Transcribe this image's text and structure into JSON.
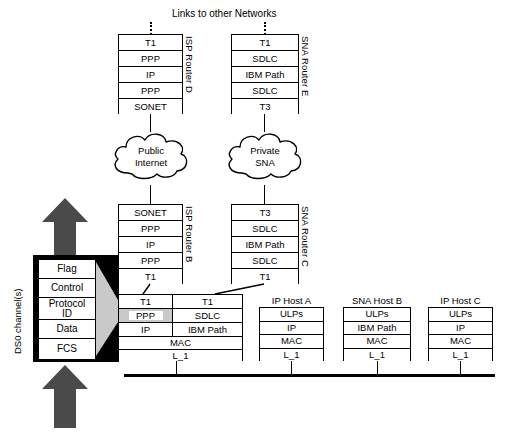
{
  "diagram": {
    "title_note": "Links to other Networks",
    "background": "#ffffff",
    "ink": "#000000",
    "arrow_color": "#3a3a3a",
    "wedge_color": "#c9c9c9"
  },
  "routers": {
    "d": {
      "side_label": "ISP Router D",
      "layers": [
        "T1",
        "PPP",
        "IP",
        "PPP",
        "SONET"
      ]
    },
    "e": {
      "side_label": "SNA Router E",
      "layers": [
        "T1",
        "SDLC",
        "IBM  Path",
        "SDLC",
        "T3"
      ]
    },
    "b": {
      "side_label": "ISP Router B",
      "layers": [
        "SONET",
        "PPP",
        "IP",
        "PPP",
        "T1"
      ]
    },
    "c": {
      "side_label": "SNA Router C",
      "layers": [
        "T3",
        "SDLC",
        "IBM  Path",
        "SDLC",
        "T1"
      ]
    }
  },
  "clouds": [
    {
      "name": "public-internet",
      "line1": "Public",
      "line2": "Internet"
    },
    {
      "name": "private-sna",
      "line1": "Private",
      "line2": "SNA"
    }
  ],
  "gateway_stack": {
    "left_column": [
      "T1",
      "PPP",
      "IP"
    ],
    "right_column": [
      "T1",
      "SDLC",
      "IBM Path"
    ],
    "shared_rows": [
      "MAC",
      "L_1"
    ]
  },
  "hosts": [
    {
      "caption": "IP Host A",
      "layers": [
        "ULPs",
        "IP",
        "MAC",
        "L_1"
      ]
    },
    {
      "caption": "SNA Host B",
      "layers": [
        "ULPs",
        "IBM Path",
        "MAC",
        "L_1"
      ]
    },
    {
      "caption": "IP Host C",
      "layers": [
        "ULPs",
        "IP",
        "MAC",
        "L_1"
      ]
    }
  ],
  "pdu_callout": {
    "side_label": "DS0 channel(s)",
    "fields": [
      "Flag",
      "Control",
      "Protocol ID",
      "Data",
      "FCS"
    ],
    "protocol_id_line1": "Protocol",
    "protocol_id_line2": "ID"
  }
}
